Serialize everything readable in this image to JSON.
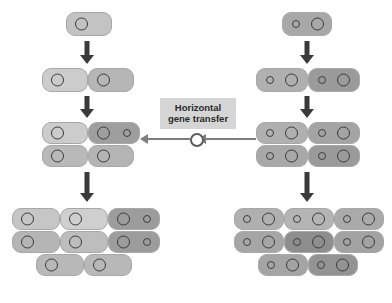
{
  "diagram": {
    "type": "biology-process-diagram",
    "background_color": "#ffffff",
    "label": {
      "text": "Horizontal\ngene transfer",
      "line1": "Horizontal",
      "line2": "gene transfer",
      "background_color": "#d5d5d5",
      "text_color": "#2a2a2a"
    },
    "legend_semantics": {
      "large_circle": "chromosome",
      "small_circle": "plasmid / transferred gene",
      "light_cell": "recipient lineage cell",
      "dark_cell": "donor / transconjugant cell"
    },
    "colors": {
      "cell_light": "#c9c9c9",
      "cell_mid": "#b0b0b0",
      "cell_dark": "#989898",
      "cell_darker": "#8a8a8a",
      "cell_border": "#a8a8a8",
      "arrow": "#3a3a3a",
      "transfer_arrow": "#7d7d7d",
      "circle_outline": "#3b3b3b"
    },
    "branches": [
      {
        "name": "left-lineage",
        "side": "left",
        "description": "Plasmid-free lineage that acquires the gene by horizontal transfer",
        "stages": [
          {
            "stage": 1,
            "cell_count": 1,
            "cells_with_plasmid": 0
          },
          {
            "stage": 2,
            "cell_count": 2,
            "cells_with_plasmid": 0
          },
          {
            "stage": 3,
            "cell_count": 4,
            "cells_with_plasmid": 1
          },
          {
            "stage": 4,
            "cell_count": 8,
            "cells_with_plasmid": 2
          }
        ]
      },
      {
        "name": "right-lineage",
        "side": "right",
        "description": "Donor lineage already carrying the plasmid",
        "stages": [
          {
            "stage": 1,
            "cell_count": 1,
            "cells_with_plasmid": 1
          },
          {
            "stage": 2,
            "cell_count": 2,
            "cells_with_plasmid": 2
          },
          {
            "stage": 3,
            "cell_count": 4,
            "cells_with_plasmid": 4
          },
          {
            "stage": 4,
            "cell_count": 8,
            "cells_with_plasmid": 8
          }
        ]
      }
    ]
  },
  "cells": [
    {
      "id": "L1-a",
      "x": 66,
      "y": 12,
      "w": 46,
      "h": 24,
      "fill": "#c3c3c3",
      "chromo": 8,
      "plasmid": null
    },
    {
      "id": "L2-a",
      "x": 42,
      "y": 68,
      "w": 46,
      "h": 24,
      "fill": "#cccccc",
      "chromo": 8,
      "plasmid": null
    },
    {
      "id": "L2-b",
      "x": 88,
      "y": 68,
      "w": 46,
      "h": 24,
      "fill": "#b6b6b6",
      "chromo": 8,
      "plasmid": null
    },
    {
      "id": "L3-a",
      "x": 42,
      "y": 122,
      "w": 46,
      "h": 22,
      "fill": "#cccccc",
      "chromo": 8,
      "plasmid": null
    },
    {
      "id": "L3-b",
      "x": 88,
      "y": 122,
      "w": 52,
      "h": 22,
      "fill": "#9e9e9e",
      "chromo": 8,
      "plasmid": 34
    },
    {
      "id": "L3-c",
      "x": 42,
      "y": 145,
      "w": 46,
      "h": 22,
      "fill": "#b9b9b9",
      "chromo": 8,
      "plasmid": null
    },
    {
      "id": "L3-d",
      "x": 88,
      "y": 145,
      "w": 46,
      "h": 22,
      "fill": "#b4b4b4",
      "chromo": 8,
      "plasmid": null
    },
    {
      "id": "L4-a",
      "x": 12,
      "y": 208,
      "w": 48,
      "h": 22,
      "fill": "#c6c6c6",
      "chromo": 8,
      "plasmid": null
    },
    {
      "id": "L4-b",
      "x": 60,
      "y": 208,
      "w": 48,
      "h": 22,
      "fill": "#cfcfcf",
      "chromo": 8,
      "plasmid": null
    },
    {
      "id": "L4-c",
      "x": 108,
      "y": 208,
      "w": 52,
      "h": 22,
      "fill": "#9c9c9c",
      "chromo": 8,
      "plasmid": 34
    },
    {
      "id": "L4-d",
      "x": 12,
      "y": 231,
      "w": 48,
      "h": 22,
      "fill": "#b5b5b5",
      "chromo": 8,
      "plasmid": null
    },
    {
      "id": "L4-e",
      "x": 60,
      "y": 231,
      "w": 48,
      "h": 22,
      "fill": "#bdbdbd",
      "chromo": 8,
      "plasmid": null
    },
    {
      "id": "L4-f",
      "x": 108,
      "y": 231,
      "w": 52,
      "h": 22,
      "fill": "#9c9c9c",
      "chromo": 8,
      "plasmid": 34
    },
    {
      "id": "L4-g",
      "x": 36,
      "y": 254,
      "w": 48,
      "h": 22,
      "fill": "#b8b8b8",
      "chromo": 8,
      "plasmid": null
    },
    {
      "id": "L4-h",
      "x": 84,
      "y": 254,
      "w": 48,
      "h": 22,
      "fill": "#b8b8b8",
      "chromo": 8,
      "plasmid": null
    },
    {
      "id": "R1-a",
      "x": 282,
      "y": 12,
      "w": 50,
      "h": 24,
      "fill": "#a8a8a8",
      "chromo": 28,
      "plasmid": 9
    },
    {
      "id": "R2-a",
      "x": 256,
      "y": 68,
      "w": 52,
      "h": 24,
      "fill": "#b0b0b0",
      "chromo": 28,
      "plasmid": 9
    },
    {
      "id": "R2-b",
      "x": 308,
      "y": 68,
      "w": 52,
      "h": 24,
      "fill": "#9a9a9a",
      "chromo": 28,
      "plasmid": 9
    },
    {
      "id": "R3-a",
      "x": 256,
      "y": 122,
      "w": 52,
      "h": 22,
      "fill": "#b0b0b0",
      "chromo": 28,
      "plasmid": 9
    },
    {
      "id": "R3-b",
      "x": 308,
      "y": 122,
      "w": 52,
      "h": 22,
      "fill": "#a4a4a4",
      "chromo": 28,
      "plasmid": 9
    },
    {
      "id": "R3-c",
      "x": 256,
      "y": 145,
      "w": 52,
      "h": 22,
      "fill": "#a8a8a8",
      "chromo": 28,
      "plasmid": 9
    },
    {
      "id": "R3-d",
      "x": 308,
      "y": 145,
      "w": 52,
      "h": 22,
      "fill": "#9a9a9a",
      "chromo": 28,
      "plasmid": 9
    },
    {
      "id": "R4-a",
      "x": 234,
      "y": 208,
      "w": 50,
      "h": 22,
      "fill": "#b0b0b0",
      "chromo": 27,
      "plasmid": 8
    },
    {
      "id": "R4-b",
      "x": 284,
      "y": 208,
      "w": 50,
      "h": 22,
      "fill": "#b4b4b4",
      "chromo": 27,
      "plasmid": 8
    },
    {
      "id": "R4-c",
      "x": 334,
      "y": 208,
      "w": 50,
      "h": 22,
      "fill": "#aaaaaa",
      "chromo": 27,
      "plasmid": 8
    },
    {
      "id": "R4-d",
      "x": 234,
      "y": 231,
      "w": 50,
      "h": 22,
      "fill": "#a6a6a6",
      "chromo": 27,
      "plasmid": 8
    },
    {
      "id": "R4-e",
      "x": 284,
      "y": 231,
      "w": 50,
      "h": 22,
      "fill": "#8e8e8e",
      "chromo": 27,
      "plasmid": 8
    },
    {
      "id": "R4-f",
      "x": 334,
      "y": 231,
      "w": 50,
      "h": 22,
      "fill": "#a2a2a2",
      "chromo": 27,
      "plasmid": 8
    },
    {
      "id": "R4-g",
      "x": 258,
      "y": 254,
      "w": 50,
      "h": 22,
      "fill": "#a4a4a4",
      "chromo": 27,
      "plasmid": 8
    },
    {
      "id": "R4-h",
      "x": 308,
      "y": 254,
      "w": 50,
      "h": 22,
      "fill": "#939393",
      "chromo": 27,
      "plasmid": 8
    }
  ],
  "arrows": [
    {
      "id": "left-div-1",
      "x": 76,
      "y": 41,
      "w": 22,
      "h": 23
    },
    {
      "id": "left-div-2",
      "x": 76,
      "y": 96,
      "w": 22,
      "h": 22
    },
    {
      "id": "left-div-3",
      "x": 76,
      "y": 172,
      "w": 22,
      "h": 30
    },
    {
      "id": "right-div-1",
      "x": 296,
      "y": 41,
      "w": 22,
      "h": 23
    },
    {
      "id": "right-div-2",
      "x": 296,
      "y": 96,
      "w": 22,
      "h": 22
    },
    {
      "id": "right-div-3",
      "x": 296,
      "y": 172,
      "w": 22,
      "h": 30
    }
  ],
  "transfer": {
    "right_segment": {
      "x": 206,
      "y": 138,
      "w": 50
    },
    "left_segment": {
      "x": 148,
      "y": 138,
      "w": 42
    },
    "right_head": {
      "x": 198,
      "y": 134
    },
    "left_head": {
      "x": 140,
      "y": 134
    },
    "plasmid": {
      "x": 190,
      "y": 133
    }
  }
}
